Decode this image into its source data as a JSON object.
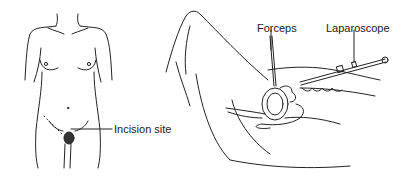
{
  "figure": {
    "labels": {
      "incision_site": "Incision site",
      "forceps": "Forceps",
      "laparoscope": "Laparoscope"
    },
    "colors": {
      "line": "#222222",
      "background": "#ffffff"
    }
  }
}
